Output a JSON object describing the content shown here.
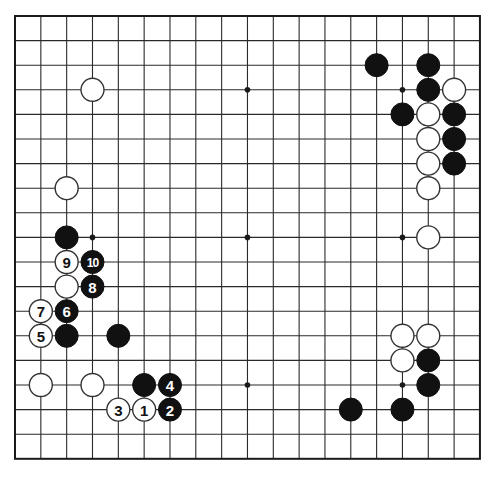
{
  "board": {
    "size": 19,
    "origin_x": 15,
    "origin_y": 16,
    "spacing_x": 25.83,
    "spacing_y": 24.6,
    "stone_radius": 11.5,
    "line_color": "#2a2a2a",
    "black_color": "#111111",
    "white_color": "#ffffff",
    "star_points": [
      [
        3,
        3
      ],
      [
        9,
        3
      ],
      [
        15,
        3
      ],
      [
        3,
        9
      ],
      [
        9,
        9
      ],
      [
        15,
        9
      ],
      [
        3,
        15
      ],
      [
        9,
        15
      ],
      [
        15,
        15
      ]
    ]
  },
  "stones": [
    {
      "color": "white",
      "col": 3,
      "row": 3,
      "label": ""
    },
    {
      "color": "white",
      "col": 2,
      "row": 7,
      "label": ""
    },
    {
      "color": "black",
      "col": 2,
      "row": 9,
      "label": ""
    },
    {
      "color": "white",
      "col": 2,
      "row": 10,
      "label": "9"
    },
    {
      "color": "black",
      "col": 3,
      "row": 10,
      "label": "10"
    },
    {
      "color": "white",
      "col": 2,
      "row": 11,
      "label": ""
    },
    {
      "color": "black",
      "col": 3,
      "row": 11,
      "label": "8"
    },
    {
      "color": "white",
      "col": 1,
      "row": 12,
      "label": "7"
    },
    {
      "color": "black",
      "col": 2,
      "row": 12,
      "label": "6"
    },
    {
      "color": "white",
      "col": 1,
      "row": 13,
      "label": "5"
    },
    {
      "color": "black",
      "col": 2,
      "row": 13,
      "label": ""
    },
    {
      "color": "black",
      "col": 4,
      "row": 13,
      "label": ""
    },
    {
      "color": "white",
      "col": 1,
      "row": 15,
      "label": ""
    },
    {
      "color": "white",
      "col": 3,
      "row": 15,
      "label": ""
    },
    {
      "color": "black",
      "col": 5,
      "row": 15,
      "label": ""
    },
    {
      "color": "black",
      "col": 6,
      "row": 15,
      "label": "4"
    },
    {
      "color": "white",
      "col": 4,
      "row": 16,
      "label": "3"
    },
    {
      "color": "white",
      "col": 5,
      "row": 16,
      "label": "1"
    },
    {
      "color": "black",
      "col": 6,
      "row": 16,
      "label": "2"
    },
    {
      "color": "black",
      "col": 14,
      "row": 2,
      "label": ""
    },
    {
      "color": "black",
      "col": 16,
      "row": 2,
      "label": ""
    },
    {
      "color": "black",
      "col": 16,
      "row": 3,
      "label": ""
    },
    {
      "color": "white",
      "col": 17,
      "row": 3,
      "label": ""
    },
    {
      "color": "black",
      "col": 15,
      "row": 4,
      "label": ""
    },
    {
      "color": "white",
      "col": 16,
      "row": 4,
      "label": ""
    },
    {
      "color": "black",
      "col": 17,
      "row": 4,
      "label": ""
    },
    {
      "color": "white",
      "col": 16,
      "row": 5,
      "label": ""
    },
    {
      "color": "black",
      "col": 17,
      "row": 5,
      "label": ""
    },
    {
      "color": "white",
      "col": 16,
      "row": 6,
      "label": ""
    },
    {
      "color": "black",
      "col": 17,
      "row": 6,
      "label": ""
    },
    {
      "color": "white",
      "col": 16,
      "row": 7,
      "label": ""
    },
    {
      "color": "white",
      "col": 16,
      "row": 9,
      "label": ""
    },
    {
      "color": "white",
      "col": 15,
      "row": 13,
      "label": ""
    },
    {
      "color": "white",
      "col": 16,
      "row": 13,
      "label": ""
    },
    {
      "color": "white",
      "col": 15,
      "row": 14,
      "label": ""
    },
    {
      "color": "black",
      "col": 16,
      "row": 14,
      "label": ""
    },
    {
      "color": "black",
      "col": 16,
      "row": 15,
      "label": ""
    },
    {
      "color": "black",
      "col": 13,
      "row": 16,
      "label": ""
    },
    {
      "color": "black",
      "col": 15,
      "row": 16,
      "label": ""
    }
  ]
}
